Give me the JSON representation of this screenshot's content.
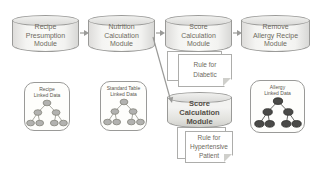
{
  "diagram": {
    "modules": [
      {
        "id": "recipe-presumption",
        "label": "Recipe\nPresumption\nModule"
      },
      {
        "id": "nutrition-calculation",
        "label": "Nutrition\nCalculation\nModule"
      },
      {
        "id": "score-calculation-top",
        "label": "Score\nCalculation\nModule"
      },
      {
        "id": "remove-allergy-recipe",
        "label": "Remove\nAllergy Recipe\nModule"
      },
      {
        "id": "score-calculation-bottom",
        "label": "Score\nCalculation\nModule",
        "emphasis": true
      }
    ],
    "rules": [
      {
        "id": "rule-diabetic",
        "label": "Rule for\nDiabetic"
      },
      {
        "id": "rule-hypertensive",
        "label": "Rule for\nHypertensive\nPatient"
      }
    ],
    "linked_data": [
      {
        "id": "recipe-linked-data",
        "label": "Recipe\nLinked Data",
        "node_style": "gray"
      },
      {
        "id": "standard-table-linked-data",
        "label": "Standard Table\nLinked Data",
        "node_style": "gray"
      },
      {
        "id": "allergy-linked-data",
        "label": "Allergy\nLinked Data",
        "node_style": "dark"
      }
    ],
    "colors": {
      "module_fill": "#f2f2f0",
      "module_border": "#9a9a98",
      "module_text": "#6e6a60",
      "emphasis_text": "#524e46",
      "note_fill": "#ffffff",
      "note_border": "#adadab",
      "tree_node_gray": "#b2b2b0",
      "tree_node_dark": "#4a4a48",
      "arrow": "#9a9a98",
      "background": "#ffffff"
    }
  }
}
